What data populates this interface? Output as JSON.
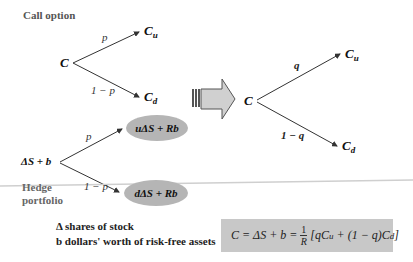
{
  "title": "Call option",
  "left_tree": {
    "root": "C",
    "up_node": {
      "base": "C",
      "sub": "u"
    },
    "down_node": {
      "base": "C",
      "sub": "d"
    },
    "up_prob": "p",
    "down_prob": "1 − p"
  },
  "right_tree": {
    "root": "C",
    "up_node": {
      "base": "C",
      "sub": "u"
    },
    "down_node": {
      "base": "C",
      "sub": "d"
    },
    "up_prob": "q",
    "down_prob": "1 − q"
  },
  "hedge_tree": {
    "root": "ΔS + b",
    "up_node": "uΔS + Rb",
    "down_node": "dΔS + Rb",
    "up_prob": "p",
    "down_prob": "1 − p",
    "label_line1": "Hedge",
    "label_line2": "portfolio"
  },
  "legend": {
    "line1": "Δ shares of stock",
    "line2": "b dollars' worth of risk-free assets"
  },
  "formula": {
    "lhs": "C = ΔS + b =",
    "frac_num": "1",
    "frac_den": "R",
    "rhs_open": "[q",
    "cu_base": "C",
    "cu_sub": "u",
    "rhs_mid": " + (1 − q)",
    "cd_base": "C",
    "cd_sub": "d",
    "rhs_close": "]"
  },
  "colors": {
    "ellipse_fill": "#b5b5b5",
    "formula_bg": "#c8c8c8",
    "arrow_fill": "#d0d0d0",
    "rule_line": "#cfcfcf"
  }
}
